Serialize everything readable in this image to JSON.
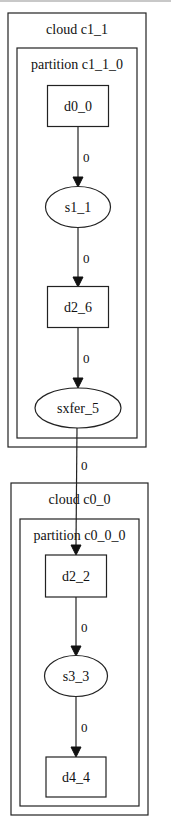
{
  "graph": {
    "clusters": [
      {
        "id": "cloud_c1_1",
        "label": "cloud c1_1",
        "x": 8,
        "y": 13,
        "w": 138,
        "h": 434
      },
      {
        "id": "partition_c1_1_0",
        "label": "partition c1_1_0",
        "x": 17,
        "y": 48,
        "w": 120,
        "h": 390
      },
      {
        "id": "cloud_c0_0",
        "label": "cloud c0_0",
        "x": 11,
        "y": 483,
        "w": 137,
        "h": 332
      },
      {
        "id": "partition_c0_0_0",
        "label": "partition c0_0_0",
        "x": 20,
        "y": 519,
        "w": 119,
        "h": 287
      }
    ],
    "nodes": [
      {
        "id": "d0_0",
        "label": "d0_0",
        "shape": "box",
        "cx": 78,
        "cy": 106,
        "w": 61,
        "h": 41
      },
      {
        "id": "s1_1",
        "label": "s1_1",
        "shape": "ellipse",
        "cx": 78,
        "cy": 207,
        "w": 65,
        "h": 41
      },
      {
        "id": "d2_6",
        "label": "d2_6",
        "shape": "box",
        "cx": 78,
        "cy": 307,
        "w": 61,
        "h": 41
      },
      {
        "id": "sxfer_5",
        "label": "sxfer_5",
        "shape": "ellipse",
        "cx": 78,
        "cy": 408,
        "w": 86,
        "h": 40
      },
      {
        "id": "d2_2",
        "label": "d2_2",
        "shape": "box",
        "cx": 76,
        "cy": 576,
        "w": 61,
        "h": 42
      },
      {
        "id": "s3_3",
        "label": "s3_3",
        "shape": "ellipse",
        "cx": 76,
        "cy": 676,
        "w": 63,
        "h": 41
      },
      {
        "id": "d4_4",
        "label": "d4_4",
        "shape": "box",
        "cx": 76,
        "cy": 777,
        "w": 60,
        "h": 40
      }
    ],
    "edges": [
      {
        "from": "d0_0",
        "to": "s1_1",
        "label": "0",
        "x1": 78,
        "y1": 127,
        "x2": 78,
        "y2": 187,
        "lx": 83,
        "ly": 162
      },
      {
        "from": "s1_1",
        "to": "d2_6",
        "label": "0",
        "x1": 78,
        "y1": 228,
        "x2": 78,
        "y2": 287,
        "lx": 83,
        "ly": 263
      },
      {
        "from": "d2_6",
        "to": "sxfer_5",
        "label": "0",
        "x1": 78,
        "y1": 328,
        "x2": 78,
        "y2": 388,
        "lx": 83,
        "ly": 363
      },
      {
        "from": "sxfer_5",
        "to": "d2_2",
        "label": "0",
        "x1": 77,
        "y1": 428,
        "x2": 76,
        "y2": 555,
        "lx": 81,
        "ly": 470
      },
      {
        "from": "d2_2",
        "to": "s3_3",
        "label": "0",
        "x1": 76,
        "y1": 597,
        "x2": 76,
        "y2": 656,
        "lx": 81,
        "ly": 632
      },
      {
        "from": "s3_3",
        "to": "d4_4",
        "label": "0",
        "x1": 76,
        "y1": 697,
        "x2": 76,
        "y2": 757,
        "lx": 81,
        "ly": 732
      }
    ]
  },
  "colors": {
    "stroke": "#222222",
    "background": "#ffffff",
    "text": "#111111"
  }
}
